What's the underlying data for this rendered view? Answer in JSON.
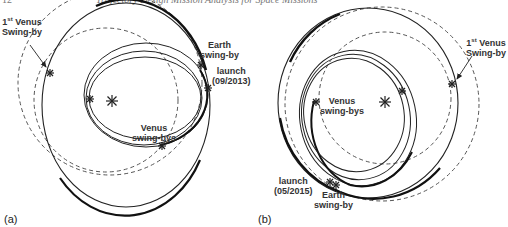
{
  "header": {
    "page_number": "12",
    "running_title": "Trajectory Design Mission Analysis for Space Missions"
  },
  "panels": [
    {
      "id": "a",
      "label": "(a)",
      "annotations": {
        "first_venus_line1": "1st Venus",
        "first_venus_line2": "Swing-by",
        "earth_line1": "Earth",
        "earth_line2": "swing-by",
        "launch_line1": "launch",
        "launch_line2": "(09/2013)",
        "venus_line1": "Venus",
        "venus_line2": "swing-bys"
      }
    },
    {
      "id": "b",
      "label": "(b)",
      "annotations": {
        "first_venus_line1": "1st Venus",
        "first_venus_line2": "Swing-by",
        "earth_line1": "Earth",
        "earth_line2": "swing-by",
        "launch_line1": "launch",
        "launch_line2": "(05/2015)",
        "venus_line1": "Venus",
        "venus_line2": "swing-bys"
      }
    }
  ],
  "legend_semantics": {
    "dashed_circles": "planetary orbits (Earth, Venus)",
    "solid_curves": "spacecraft transfer orbits",
    "star_markers": "Sun and swing-by / launch events"
  },
  "colors": {
    "line": "#2a2a2a",
    "dashed": "#555555",
    "text": "#333333"
  }
}
